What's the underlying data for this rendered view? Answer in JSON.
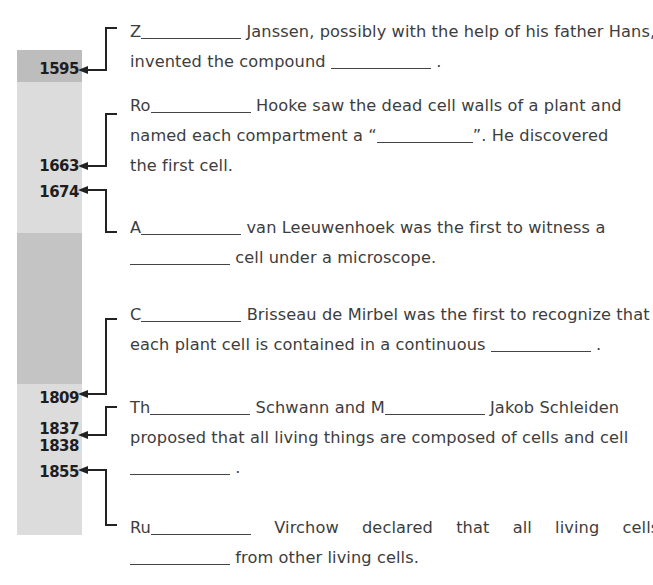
{
  "timeline": {
    "segments": [
      {
        "top": 50,
        "height": 32,
        "color": "#bdbdbd"
      },
      {
        "top": 82,
        "height": 151,
        "color": "#dcdcdc"
      },
      {
        "top": 233,
        "height": 151,
        "color": "#c4c4c4"
      },
      {
        "top": 384,
        "height": 151,
        "color": "#dcdcdc"
      }
    ],
    "years": [
      {
        "label": "1595",
        "y": 56
      },
      {
        "label": "1663",
        "y": 153
      },
      {
        "label": "1674",
        "y": 178
      },
      {
        "label": "1809",
        "y": 386
      },
      {
        "label": "1837",
        "y": 418
      },
      {
        "label": "1838",
        "y": 435
      },
      {
        "label": "1855",
        "y": 461
      }
    ]
  },
  "entries": [
    {
      "id": "janssen",
      "year": "1595",
      "lines": [
        {
          "parts": [
            "Z",
            "_blank",
            "Janssen, possibly with the help of his father Hans,"
          ]
        },
        {
          "parts": [
            "invented the compound ",
            "_blank",
            " ."
          ]
        }
      ]
    },
    {
      "id": "hooke",
      "year": "1663",
      "lines": [
        {
          "parts": [
            "Ro",
            "_blank",
            " Hooke saw the dead cell walls of a plant and"
          ]
        },
        {
          "parts": [
            "named each compartment a “",
            "_blank",
            "”.  He discovered"
          ]
        },
        {
          "parts": [
            "the first cell."
          ]
        }
      ]
    },
    {
      "id": "leeuwenhoek",
      "year": "1674",
      "lines": [
        {
          "parts": [
            "A",
            "_blank",
            " van Leeuwenhoek was the first to witness a"
          ]
        },
        {
          "parts": [
            "_blank",
            " cell under a microscope."
          ]
        }
      ]
    },
    {
      "id": "mirbel",
      "year": "1809",
      "lines": [
        {
          "parts": [
            "C",
            "_blank",
            " Brisseau de Mirbel was the first to recognize that"
          ]
        },
        {
          "parts": [
            "each plant cell is contained in a continuous ",
            "_blank",
            " ."
          ]
        }
      ]
    },
    {
      "id": "schwann-schleiden",
      "year": "1837 / 1838",
      "lines": [
        {
          "parts": [
            "Th",
            "_blank",
            " Schwann and M",
            "_blank",
            " Jakob Schleiden"
          ]
        },
        {
          "parts": [
            "proposed that all living things are composed of cells and cell"
          ]
        },
        {
          "parts": [
            "_blank",
            " ."
          ]
        }
      ]
    },
    {
      "id": "virchow",
      "year": "1855",
      "lines": [
        {
          "parts": [
            "Ru",
            "_blank",
            " Virchow declared that all living cells"
          ]
        },
        {
          "parts": [
            "_blank",
            " from other living cells."
          ]
        }
      ]
    }
  ],
  "text": {
    "e1_l1_a": "Z",
    "e1_l1_b": "Janssen, possibly with the help of his father Hans,",
    "e1_l2_a": "invented the compound",
    "e1_l2_b": ".",
    "e2_l1_a": "Ro",
    "e2_l1_b": "Hooke saw the dead cell walls of a plant and",
    "e2_l2_a": "named each compartment a “",
    "e2_l2_b": "”.  He discovered",
    "e2_l3": "the first cell.",
    "e3_l1_a": "A",
    "e3_l1_b": "van Leeuwenhoek was the first to witness a",
    "e3_l2_b": "cell under a microscope.",
    "e4_l1_a": "C",
    "e4_l1_b": "Brisseau de Mirbel was the first to recognize that",
    "e4_l2_a": "each plant cell is contained in a continuous",
    "e4_l2_b": ".",
    "e5_l1_a": "Th",
    "e5_l1_b": "Schwann and M",
    "e5_l1_c": "Jakob Schleiden",
    "e5_l2": "proposed that all living things are composed of cells and cell",
    "e5_l3_b": ".",
    "e6_l1_a": "Ru",
    "e6_l1_b": "Virchow declared that all living cells",
    "e6_l2_b": "from other living cells."
  },
  "colors": {
    "bar_dark": "#bdbdbd",
    "bar_light": "#dcdcdc",
    "bar_mid": "#c4c4c4",
    "line": "#222222",
    "text": "#3d3d3d"
  }
}
